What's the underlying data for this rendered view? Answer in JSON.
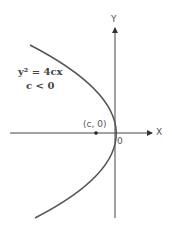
{
  "diagram": {
    "equation": "y² = 4cx",
    "condition": "c < 0",
    "x_axis_label": "X",
    "y_axis_label": "Y",
    "origin_label": "0",
    "focus_label": "(c, 0)",
    "colors": {
      "curve": "#555555",
      "axis": "#444444",
      "text": "#444444"
    }
  }
}
